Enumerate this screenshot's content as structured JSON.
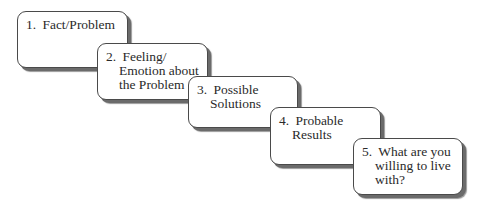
{
  "diagram": {
    "type": "staircase-flow",
    "steps": [
      {
        "number": "1.",
        "lines": [
          "Fact/Problem"
        ]
      },
      {
        "number": "2.",
        "lines": [
          "Feeling/",
          "Emotion about",
          "the Problem"
        ]
      },
      {
        "number": "3.",
        "lines": [
          "Possible",
          "Solutions"
        ]
      },
      {
        "number": "4.",
        "lines": [
          "Probable",
          "Results"
        ]
      },
      {
        "number": "5.",
        "lines": [
          "What are you",
          "willing to live",
          "with?"
        ]
      }
    ]
  }
}
